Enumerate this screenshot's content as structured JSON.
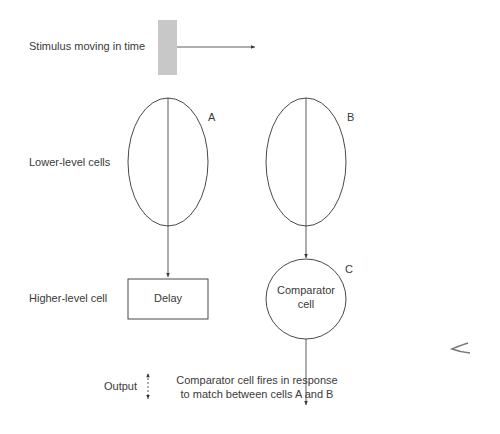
{
  "diagram": {
    "stimulus_label": "Stimulus moving in time",
    "row_labels": {
      "lower": "Lower-level cells",
      "higher": "Higher-level cell",
      "output": "Output"
    },
    "cells": {
      "a": {
        "letter": "A"
      },
      "b": {
        "letter": "B"
      },
      "c": {
        "letter": "C",
        "line1": "Comparator",
        "line2": "cell"
      }
    },
    "delay_label": "Delay",
    "caption": {
      "line1": "Comparator cell fires in response",
      "line2": "to match between cells A and B"
    },
    "colors": {
      "stroke": "#333333",
      "stimulus_bar": "#c8c8c8",
      "text": "#3a3a3a"
    }
  }
}
